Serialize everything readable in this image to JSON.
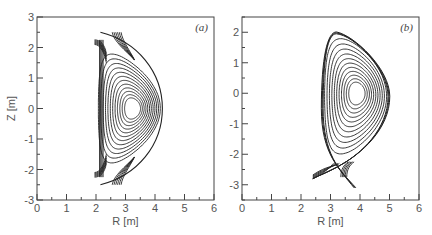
{
  "chart_data": [
    {
      "type": "contour",
      "panel_label": "(a)",
      "xlabel": "R [m]",
      "ylabel": "Z [m]",
      "xlim": [
        0,
        6
      ],
      "ylim": [
        -3,
        3
      ],
      "xticks": [
        "0",
        "1",
        "2",
        "3",
        "4",
        "5",
        "6"
      ],
      "yticks": [
        "3",
        "2",
        "1",
        "0",
        "-1",
        "-2",
        "-3"
      ],
      "grid": false,
      "description": "Double-null flux surfaces; magnetic axis near R=3.25, Z=0; outboard edge near R=4.25; inboard wall near R=2.1; X-points near Z=±2.2",
      "magnetic_axis": {
        "R": 3.25,
        "Z": 0
      },
      "num_closed_surfaces": 12,
      "separatrix": {
        "R_in": 2.1,
        "R_out": 4.25,
        "Z_top": 2.5,
        "Z_bottom": -2.5
      }
    },
    {
      "type": "contour",
      "panel_label": "(b)",
      "xlabel": "R [m]",
      "ylabel": "",
      "xlim": [
        0,
        6
      ],
      "ylim": [
        -3.5,
        2.5
      ],
      "xticks": [
        "0",
        "1",
        "2",
        "3",
        "4",
        "5",
        "6"
      ],
      "yticks": [
        "2",
        "1",
        "0",
        "-1",
        "-2",
        "-3"
      ],
      "grid": false,
      "description": "Single-null (lower) flux surfaces; magnetic axis near R=3.9, Z=0; outboard edge near R=4.95; top near Z=1.95; X-point near R=3.4, Z=-2.3; divertor legs to R≈2.4,Z≈-2.8 and R≈3.8,Z≈-3.1",
      "magnetic_axis": {
        "R": 3.9,
        "Z": 0
      },
      "num_closed_surfaces": 11,
      "separatrix": {
        "R_in": 2.7,
        "R_out": 4.95,
        "Z_top": 1.95,
        "Z_xpoint": -2.3
      }
    }
  ]
}
